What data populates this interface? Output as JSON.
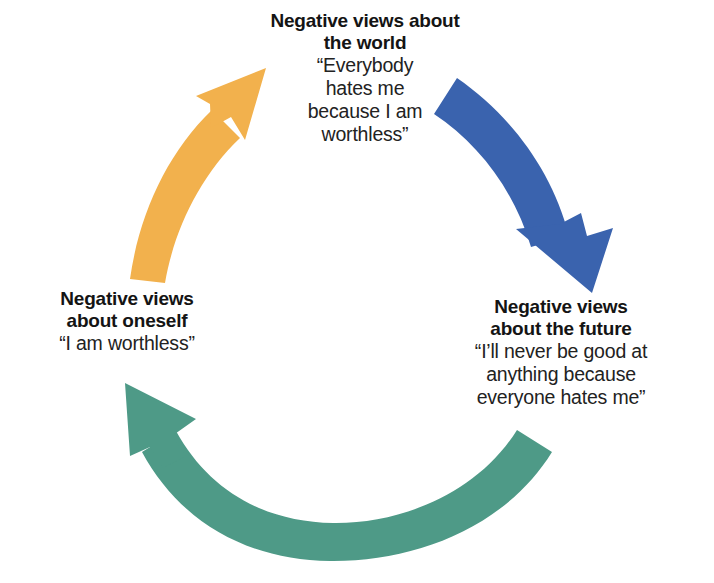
{
  "diagram": {
    "type": "cycle",
    "title_visible": false,
    "background_color": "#ffffff",
    "nodes": [
      {
        "id": "world",
        "name": "negative-views-about-the-world",
        "heading_lines": [
          "Negative views about",
          "the world"
        ],
        "quote_lines": [
          "“Everybody",
          "hates me",
          "because I am",
          "worthless”"
        ],
        "position": "top"
      },
      {
        "id": "future",
        "name": "negative-views-about-the-future",
        "heading_lines": [
          "Negative views",
          "about the future"
        ],
        "quote_lines": [
          "“I’ll never be good at",
          "anything because",
          "everyone hates me”"
        ],
        "position": "bottom-right"
      },
      {
        "id": "self",
        "name": "negative-views-about-oneself",
        "heading_lines": [
          "Negative views",
          "about oneself"
        ],
        "quote_lines": [
          "“I am worthless”"
        ],
        "position": "bottom-left"
      }
    ],
    "arrows": [
      {
        "id": "arrow-self-to-world",
        "name": "orange-arrow-oneself-to-world",
        "color": "#F2B14D",
        "from": "self",
        "to": "world",
        "direction": "up-right"
      },
      {
        "id": "arrow-world-to-future",
        "name": "blue-arrow-world-to-future",
        "color": "#3A63AE",
        "from": "world",
        "to": "future",
        "direction": "down-right"
      },
      {
        "id": "arrow-future-to-self",
        "name": "green-arrow-future-to-oneself",
        "color": "#4E9A87",
        "from": "future",
        "to": "self",
        "direction": "up-left"
      }
    ]
  }
}
